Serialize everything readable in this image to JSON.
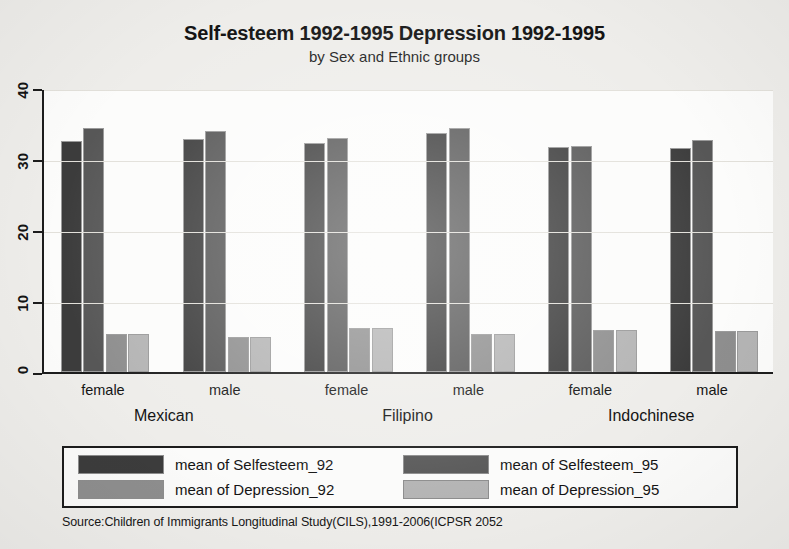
{
  "title": "Self-esteem 1992-1995 Depression 1992-1995",
  "subtitle": "by Sex and Ethnic groups",
  "source_note": "Source:Children of Immigrants Longitudinal Study(CILS),1991-2006(ICPSR 2052",
  "legend": {
    "items": [
      {
        "label": "mean of Selfesteem_92",
        "color": "#3c3c3c"
      },
      {
        "label": "mean of Selfesteem_95",
        "color": "#575757"
      },
      {
        "label": "mean of Depression_92",
        "color": "#8e8e8e"
      },
      {
        "label": "mean of Depression_95",
        "color": "#b4b4b4"
      }
    ]
  },
  "axis": {
    "y_ticks": [
      "0",
      "10",
      "20",
      "30",
      "40"
    ],
    "x_sex_labels": [
      "female",
      "male",
      "female",
      "male",
      "female",
      "male"
    ],
    "x_group_labels": [
      "Mexican",
      "Filipino",
      "Indochinese"
    ]
  },
  "chart_data": {
    "type": "bar",
    "title": "Self-esteem 1992-1995 Depression 1992-1995",
    "subtitle": "by Sex and Ethnic groups",
    "xlabel": "",
    "ylabel": "",
    "ylim": [
      0,
      40
    ],
    "yticks": [
      0,
      10,
      20,
      30,
      40
    ],
    "grid": true,
    "legend_position": "bottom",
    "categories": [
      "Mexican female",
      "Mexican male",
      "Filipino female",
      "Filipino male",
      "Indochinese female",
      "Indochinese male"
    ],
    "group_labels": [
      "Mexican",
      "Filipino",
      "Indochinese"
    ],
    "sex_labels": [
      "female",
      "male",
      "female",
      "male",
      "female",
      "male"
    ],
    "series": [
      {
        "name": "mean of Selfesteem_92",
        "color": "#3c3c3c",
        "values": [
          32.5,
          32.8,
          32.2,
          33.7,
          31.7,
          31.6
        ]
      },
      {
        "name": "mean of Selfesteem_95",
        "color": "#575757",
        "values": [
          34.3,
          34.0,
          33.0,
          34.4,
          31.9,
          32.7
        ]
      },
      {
        "name": "mean of Depression_92",
        "color": "#8e8e8e",
        "values": [
          5.3,
          4.9,
          6.2,
          5.3,
          5.9,
          5.8
        ]
      },
      {
        "name": "mean of Depression_95",
        "color": "#b4b4b4",
        "values": [
          5.3,
          4.9,
          6.2,
          5.4,
          5.9,
          5.8
        ]
      }
    ],
    "source": "Source:Children of Immigrants Longitudinal Study(CILS),1991-2006(ICPSR 2052"
  }
}
